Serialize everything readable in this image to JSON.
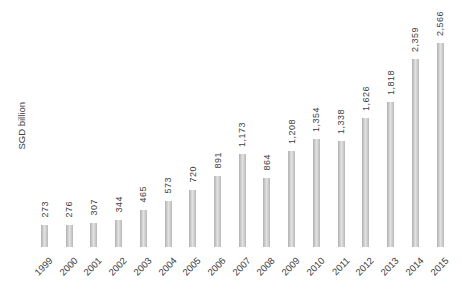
{
  "chart_data": {
    "type": "bar",
    "title": "",
    "xlabel": "",
    "ylabel": "SGD billion",
    "categories": [
      "1999",
      "2000",
      "2001",
      "2002",
      "2003",
      "2004",
      "2005",
      "2006",
      "2007",
      "2008",
      "2009",
      "2010",
      "2011",
      "2012",
      "2013",
      "2014",
      "2015"
    ],
    "values": [
      273,
      276,
      307,
      344,
      465,
      573,
      720,
      891,
      1173,
      864,
      1208,
      1354,
      1338,
      1626,
      1818,
      2359,
      2566
    ],
    "value_labels": [
      "273",
      "276",
      "307",
      "344",
      "465",
      "573",
      "720",
      "891",
      "1,173",
      "864",
      "1,208",
      "1,354",
      "1,338",
      "1,626",
      "1,818",
      "2,359",
      "2,566"
    ],
    "ylim": [
      0,
      2566
    ],
    "grid": false,
    "legend": false,
    "colors": {
      "bar_edge": "#b0b0b0",
      "bar_center": "#e2e2e2",
      "bar_edge_right": "#b8b8b8",
      "text": "#3d3d3d",
      "background": "#ffffff"
    }
  }
}
